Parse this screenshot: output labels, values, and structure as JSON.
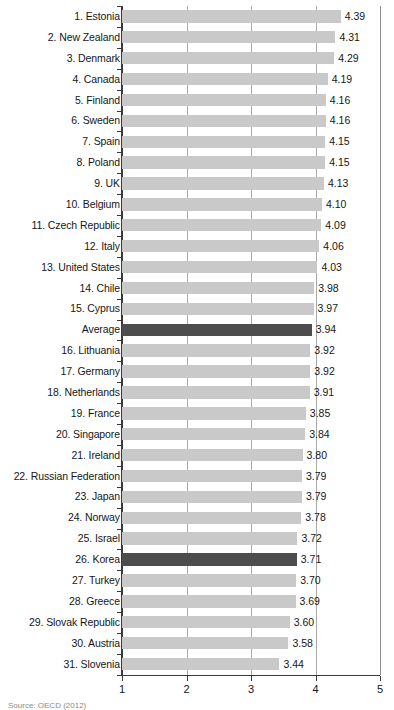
{
  "chart_data": {
    "type": "bar",
    "orientation": "horizontal",
    "title": "",
    "subtitle": "",
    "xlabel": "",
    "ylabel": "",
    "xlim": [
      1,
      5
    ],
    "xticks": [
      "1",
      "2",
      "3",
      "4",
      "5"
    ],
    "grid": true,
    "legend": null,
    "highlight_color": "#4d4d4d",
    "bar_color": "#c9c9c9",
    "categories": [
      "1. Estonia",
      "2. New Zealand",
      "3. Denmark",
      "4. Canada",
      "5. Finland",
      "6. Sweden",
      "7. Spain",
      "8. Poland",
      "9. UK",
      "10. Belgium",
      "11. Czech Republic",
      "12. Italy",
      "13. United States",
      "14. Chile",
      "15. Cyprus",
      "Average",
      "16. Lithuania",
      "17. Germany",
      "18. Netherlands",
      "19. France",
      "20. Singapore",
      "21. Ireland",
      "22. Russian Federation",
      "23. Japan",
      "24. Norway",
      "25. Israel",
      "26. Korea",
      "27. Turkey",
      "28. Greece",
      "29. Slovak Republic",
      "30. Austria",
      "31. Slovenia"
    ],
    "values": [
      4.39,
      4.31,
      4.29,
      4.19,
      4.16,
      4.16,
      4.15,
      4.15,
      4.13,
      4.1,
      4.09,
      4.06,
      4.03,
      3.98,
      3.97,
      3.94,
      3.92,
      3.92,
      3.91,
      3.85,
      3.84,
      3.8,
      3.79,
      3.79,
      3.78,
      3.72,
      3.71,
      3.7,
      3.69,
      3.6,
      3.58,
      3.44
    ],
    "value_labels": [
      "4.39",
      "4.31",
      "4.29",
      "4.19",
      "4.16",
      "4.16",
      "4.15",
      "4.15",
      "4.13",
      "4.10",
      "4.09",
      "4.06",
      "4.03",
      "3.98",
      "3.97",
      "3.94",
      "3.92",
      "3.92",
      "3.91",
      "3.85",
      "3.84",
      "3.80",
      "3.79",
      "3.79",
      "3.78",
      "3.72",
      "3.71",
      "3.70",
      "3.69",
      "3.60",
      "3.58",
      "3.44"
    ],
    "highlighted": [
      false,
      false,
      false,
      false,
      false,
      false,
      false,
      false,
      false,
      false,
      false,
      false,
      false,
      false,
      false,
      true,
      false,
      false,
      false,
      false,
      false,
      false,
      false,
      false,
      false,
      false,
      true,
      false,
      false,
      false,
      false,
      false
    ]
  },
  "footer": {
    "source": "Source: OECD (2012)"
  }
}
